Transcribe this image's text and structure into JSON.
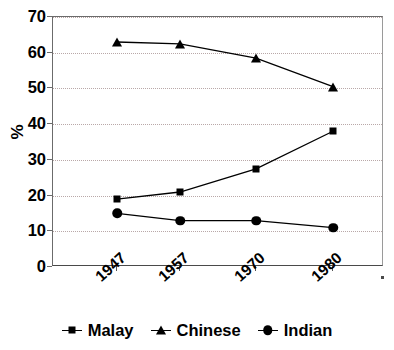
{
  "chart_data": {
    "type": "line",
    "title": "",
    "subtitle": "",
    "xlabel": "",
    "ylabel": "%",
    "categories": [
      "1947",
      "1957",
      "1970",
      "1980"
    ],
    "series": [
      {
        "name": "Malay",
        "marker": "square",
        "values": [
          19,
          21,
          27.5,
          38
        ]
      },
      {
        "name": "Chinese",
        "marker": "triangle",
        "values": [
          63,
          62.5,
          58.5,
          50.5
        ]
      },
      {
        "name": "Indian",
        "marker": "circle",
        "values": [
          15,
          13,
          13,
          11
        ]
      }
    ],
    "ylim": [
      0,
      70
    ],
    "yticks": [
      0,
      10,
      20,
      30,
      40,
      50,
      60,
      70
    ],
    "ytick_labels": [
      "0",
      "10",
      "20",
      "30",
      "40",
      "50",
      "60",
      "70"
    ],
    "grid": "horizontal-dotted",
    "legend_position": "bottom-center",
    "line_color": "#000000",
    "grid_color": "#b9a8a8",
    "axis_color": "#6b6b6b",
    "background": "#ffffff"
  },
  "axes": {
    "y_title": "%"
  },
  "legend": {
    "entries": [
      {
        "label": "Malay",
        "marker": "square-marker-icon"
      },
      {
        "label": "Chinese",
        "marker": "triangle-marker-icon"
      },
      {
        "label": "Indian",
        "marker": "circle-marker-icon"
      }
    ]
  }
}
